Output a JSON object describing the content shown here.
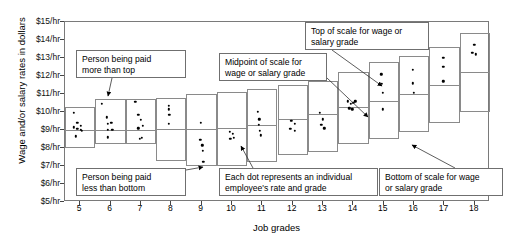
{
  "chart_data": {
    "type": "scatter",
    "title": "",
    "xlabel": "Job grades",
    "ylabel": "Wage and/or salary rates in dollars",
    "xlim": [
      4.5,
      18.5
    ],
    "ylim": [
      5,
      15
    ],
    "grid": false,
    "legend": null,
    "ytick_labels": [
      "$15/hr",
      "$14/hr",
      "$13/hr",
      "$12/hr",
      "$11/hr",
      "$10/hr",
      "$9/hr",
      "$8/hr",
      "$7/hr",
      "$6/hr",
      "$5/hr"
    ],
    "ytick_values": [
      15,
      14,
      13,
      12,
      11,
      10,
      9,
      8,
      7,
      6,
      5
    ],
    "xtick_labels": [
      "5",
      "6",
      "7",
      "8",
      "9",
      "10",
      "11",
      "12",
      "13",
      "14",
      "15",
      "16",
      "17",
      "18"
    ],
    "xtick_values": [
      5,
      6,
      7,
      8,
      9,
      10,
      11,
      12,
      13,
      14,
      15,
      16,
      17,
      18
    ],
    "grade_ranges": [
      {
        "grade": 5,
        "bottom": 8.0,
        "midpoint": 9.0,
        "top": 10.3
      },
      {
        "grade": 6,
        "bottom": 8.2,
        "midpoint": 9.0,
        "top": 10.7
      },
      {
        "grade": 7,
        "bottom": 8.2,
        "midpoint": 9.0,
        "top": 10.7
      },
      {
        "grade": 8,
        "bottom": 7.3,
        "midpoint": 9.05,
        "top": 10.8
      },
      {
        "grade": 9,
        "bottom": 7.0,
        "midpoint": 9.05,
        "top": 11.0
      },
      {
        "grade": 10,
        "bottom": 7.0,
        "midpoint": 9.1,
        "top": 11.1
      },
      {
        "grade": 11,
        "bottom": 7.2,
        "midpoint": 9.3,
        "top": 11.3
      },
      {
        "grade": 12,
        "bottom": 7.6,
        "midpoint": 9.6,
        "top": 11.5
      },
      {
        "grade": 13,
        "bottom": 7.8,
        "midpoint": 9.9,
        "top": 11.7
      },
      {
        "grade": 14,
        "bottom": 8.2,
        "midpoint": 10.3,
        "top": 12.2
      },
      {
        "grade": 15,
        "bottom": 8.5,
        "midpoint": 10.6,
        "top": 12.8
      },
      {
        "grade": 16,
        "bottom": 8.9,
        "midpoint": 11.0,
        "top": 13.1
      },
      {
        "grade": 17,
        "bottom": 9.4,
        "midpoint": 11.5,
        "top": 13.6
      },
      {
        "grade": 18,
        "bottom": 10.0,
        "midpoint": 12.2,
        "top": 14.4
      }
    ],
    "points": [
      {
        "grade": 4.78,
        "rate": 9.95
      },
      {
        "grade": 4.78,
        "rate": 9.15
      },
      {
        "grade": 4.9,
        "rate": 9.4
      },
      {
        "grade": 4.9,
        "rate": 9.05
      },
      {
        "grade": 4.86,
        "rate": 8.65
      },
      {
        "grade": 5.02,
        "rate": 9.25
      },
      {
        "grade": 5.02,
        "rate": 9.0
      },
      {
        "grade": 5.06,
        "rate": 8.95
      },
      {
        "grade": 5.72,
        "rate": 10.45
      },
      {
        "grade": 5.88,
        "rate": 9.7
      },
      {
        "grade": 5.92,
        "rate": 9.35
      },
      {
        "grade": 6.02,
        "rate": 9.4
      },
      {
        "grade": 5.92,
        "rate": 9.0
      },
      {
        "grade": 6.06,
        "rate": 9.0
      },
      {
        "grade": 5.92,
        "rate": 8.6
      },
      {
        "grade": 6.82,
        "rate": 10.55
      },
      {
        "grade": 6.92,
        "rate": 9.85
      },
      {
        "grade": 7.0,
        "rate": 9.55
      },
      {
        "grade": 6.92,
        "rate": 9.1
      },
      {
        "grade": 7.06,
        "rate": 9.25
      },
      {
        "grade": 7.04,
        "rate": 8.55
      },
      {
        "grade": 6.96,
        "rate": 8.5
      },
      {
        "grade": 7.92,
        "rate": 10.35
      },
      {
        "grade": 7.92,
        "rate": 10.15
      },
      {
        "grade": 7.94,
        "rate": 9.85
      },
      {
        "grade": 7.92,
        "rate": 9.35
      },
      {
        "grade": 8.98,
        "rate": 9.4
      },
      {
        "grade": 8.96,
        "rate": 8.45
      },
      {
        "grade": 9.02,
        "rate": 8.15
      },
      {
        "grade": 9.04,
        "rate": 7.85
      },
      {
        "grade": 9.06,
        "rate": 7.25
      },
      {
        "grade": 9.92,
        "rate": 8.9
      },
      {
        "grade": 10.02,
        "rate": 8.8
      },
      {
        "grade": 9.94,
        "rate": 8.5
      },
      {
        "grade": 10.06,
        "rate": 8.55
      },
      {
        "grade": 10.86,
        "rate": 10.0
      },
      {
        "grade": 10.9,
        "rate": 9.6
      },
      {
        "grade": 10.88,
        "rate": 9.3
      },
      {
        "grade": 10.92,
        "rate": 8.95
      },
      {
        "grade": 10.96,
        "rate": 8.7
      },
      {
        "grade": 11.96,
        "rate": 9.5
      },
      {
        "grade": 12.08,
        "rate": 9.35
      },
      {
        "grade": 11.92,
        "rate": 9.05
      },
      {
        "grade": 12.06,
        "rate": 8.95
      },
      {
        "grade": 12.9,
        "rate": 9.95
      },
      {
        "grade": 13.0,
        "rate": 9.6
      },
      {
        "grade": 12.94,
        "rate": 9.3
      },
      {
        "grade": 13.04,
        "rate": 9.1
      },
      {
        "grade": 13.82,
        "rate": 10.6
      },
      {
        "grade": 13.92,
        "rate": 10.45
      },
      {
        "grade": 14.0,
        "rate": 10.5
      },
      {
        "grade": 14.06,
        "rate": 10.6
      },
      {
        "grade": 13.86,
        "rate": 10.2
      },
      {
        "grade": 13.96,
        "rate": 10.15
      },
      {
        "grade": 14.92,
        "rate": 12.1
      },
      {
        "grade": 14.94,
        "rate": 11.55
      },
      {
        "grade": 14.96,
        "rate": 11.05
      },
      {
        "grade": 14.96,
        "rate": 10.15
      },
      {
        "grade": 15.96,
        "rate": 12.35
      },
      {
        "grade": 15.96,
        "rate": 11.6
      },
      {
        "grade": 16.0,
        "rate": 11.05
      },
      {
        "grade": 16.96,
        "rate": 13.0
      },
      {
        "grade": 16.96,
        "rate": 12.5
      },
      {
        "grade": 16.96,
        "rate": 11.7
      },
      {
        "grade": 17.98,
        "rate": 13.75
      },
      {
        "grade": 17.92,
        "rate": 13.3
      },
      {
        "grade": 18.04,
        "rate": 13.2
      }
    ],
    "annotations": [
      {
        "id": "more-than-top",
        "text": "Person being paid\nmore than top",
        "box": {
          "x": 76,
          "y": 50,
          "w": 110,
          "h": 28
        },
        "arrow": {
          "from": [
            112,
            78
          ],
          "to": [
            108,
            96
          ]
        }
      },
      {
        "id": "less-than-bottom",
        "text": "Person being paid\nless than bottom",
        "box": {
          "x": 76,
          "y": 168,
          "w": 110,
          "h": 28
        },
        "arrow": {
          "from": [
            186,
            170
          ],
          "to": [
            203,
            167
          ]
        }
      },
      {
        "id": "midpoint-of-scale",
        "text": "Midpoint of scale for\nwage or salary grade",
        "box": {
          "x": 219,
          "y": 53,
          "w": 108,
          "h": 28
        },
        "arrow": {
          "from": [
            327,
            78
          ],
          "to": [
            368,
            117
          ]
        }
      },
      {
        "id": "each-dot",
        "text": "Each dot represents an individual\nemployee's rate and grade",
        "box": {
          "x": 219,
          "y": 168,
          "w": 159,
          "h": 28
        },
        "arrow": {
          "from": [
            253,
            168
          ],
          "to": [
            241,
            146
          ]
        }
      },
      {
        "id": "top-of-scale",
        "text": "Top of scale for wage or\nsalary grade",
        "box": {
          "x": 305,
          "y": 22,
          "w": 124,
          "h": 28
        },
        "arrow": {
          "from": [
            332,
            50
          ],
          "to": [
            382,
            86
          ]
        }
      },
      {
        "id": "bottom-of-scale",
        "text": "Bottom of scale for wage\nor salary grade",
        "box": {
          "x": 379,
          "y": 168,
          "w": 124,
          "h": 28
        },
        "arrow": {
          "from": [
            455,
            168
          ],
          "to": [
            412,
            145
          ]
        }
      }
    ]
  },
  "colors": {
    "axis": "#7a7a7a",
    "box": "#8a8a8a",
    "dot": "#000000",
    "text": "#000000",
    "callout_border": "#6f6f6f",
    "background": "#ffffff"
  }
}
